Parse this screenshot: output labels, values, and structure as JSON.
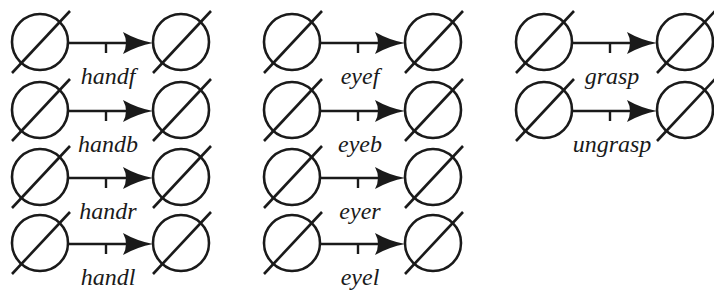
{
  "diagram": {
    "stroke_color": "#1a1a1a",
    "background": "#ffffff",
    "node_icon": "empty-set-icon",
    "columns": [
      {
        "id": "hand",
        "transitions": [
          {
            "label": "handf"
          },
          {
            "label": "handb"
          },
          {
            "label": "handr"
          },
          {
            "label": "handl"
          }
        ]
      },
      {
        "id": "eye",
        "transitions": [
          {
            "label": "eyef"
          },
          {
            "label": "eyeb"
          },
          {
            "label": "eyer"
          },
          {
            "label": "eyel"
          }
        ]
      },
      {
        "id": "grasp",
        "transitions": [
          {
            "label": "grasp"
          },
          {
            "label": "ungrasp"
          }
        ]
      }
    ]
  }
}
